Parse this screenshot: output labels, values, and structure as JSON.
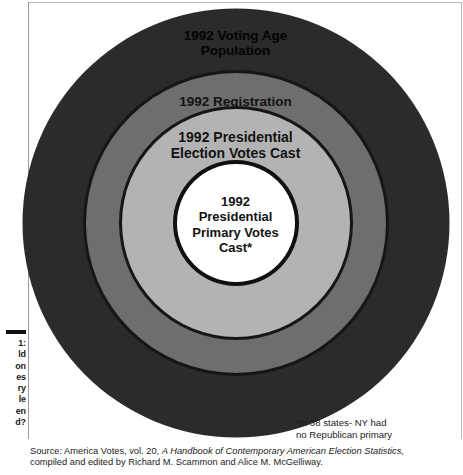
{
  "figure": {
    "type": "concentric-circles",
    "rings": [
      {
        "id": "voting-age-population",
        "label": "1992 Voting Age\nPopulation",
        "line1": "1992 Voting Age",
        "line2": "Population",
        "fill": "#2b2b2b"
      },
      {
        "id": "registration",
        "label": "1992 Registration",
        "line1": "1992 Registration",
        "line2": "",
        "fill": "#6e6e6e"
      },
      {
        "id": "presidential-election-votes-cast",
        "label": "1992 Presidential\nElection Votes Cast",
        "line1": "1992 Presidential",
        "line2": "Election Votes Cast",
        "fill": "#b3b3b3"
      },
      {
        "id": "presidential-primary-votes-cast",
        "label": "1992\nPresidential\nPrimary Votes\nCast*",
        "line1": "1992",
        "line2": "Presidential",
        "line3": "Primary Votes",
        "line4": "Cast*",
        "fill": "#ffffff"
      }
    ]
  },
  "margin_caption": {
    "line1": "1:",
    "line2": "ld",
    "line3": "on",
    "line4": "es",
    "line5": "ry",
    "line6": "le",
    "line7": "en",
    "line8": "d?"
  },
  "footnote": {
    "line1": "*in 38 states- NY had",
    "line2": "no Republican primary"
  },
  "source": {
    "prefix": "Source: America Votes, vol. 20, ",
    "title_italic": "A Handbook of Contemporary American Election Statistics,",
    "line2": "compiled and edited by Richard M. Scammon and Alice M. McGelliway."
  },
  "chart_data": {
    "type": "pie",
    "xlabel": "",
    "ylabel": "",
    "categories": [
      "1992 Voting Age Population",
      "1992 Registration",
      "1992 Presidential Election Votes Cast",
      "1992 Presidential Primary Votes Cast*"
    ],
    "values": [
      427,
      300,
      228,
      118
    ],
    "value_units": "relative circle diameter (px)",
    "colors": [
      "#2b2b2b",
      "#6e6e6e",
      "#b3b3b3",
      "#ffffff"
    ],
    "legend": "none",
    "grid": false
  }
}
